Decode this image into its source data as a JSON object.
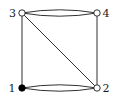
{
  "diagram": {
    "type": "multigraph",
    "nodes": [
      {
        "id": "1",
        "label": "1",
        "filled": true
      },
      {
        "id": "2",
        "label": "2",
        "filled": false
      },
      {
        "id": "3",
        "label": "3",
        "filled": false
      },
      {
        "id": "4",
        "label": "4",
        "filled": false
      }
    ],
    "edges": [
      {
        "from": "1",
        "to": "3",
        "style": "straight"
      },
      {
        "from": "2",
        "to": "4",
        "style": "straight"
      },
      {
        "from": "3",
        "to": "2",
        "style": "straight"
      },
      {
        "from": "3",
        "to": "4",
        "style": "curved-upper"
      },
      {
        "from": "3",
        "to": "4",
        "style": "curved-lower"
      },
      {
        "from": "1",
        "to": "2",
        "style": "curved-upper"
      },
      {
        "from": "1",
        "to": "2",
        "style": "curved-lower"
      }
    ],
    "colors": {
      "stroke": "#1a1a1a",
      "filled_node": "#000000",
      "hollow_node": "#ffffff"
    }
  }
}
